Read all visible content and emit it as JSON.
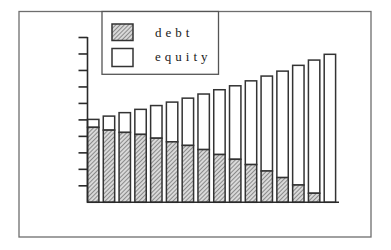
{
  "chart_data": {
    "type": "bar",
    "stacked": true,
    "title": "",
    "xlabel": "",
    "ylabel": "",
    "categories": [
      "1",
      "2",
      "3",
      "4",
      "5",
      "6",
      "7",
      "8",
      "9",
      "10",
      "11",
      "12",
      "13",
      "14",
      "15",
      "16"
    ],
    "series": [
      {
        "name": "debt",
        "pattern": "hatched",
        "values": [
          4.55,
          4.38,
          4.24,
          4.12,
          3.89,
          3.67,
          3.45,
          3.2,
          2.9,
          2.61,
          2.29,
          1.9,
          1.5,
          1.05,
          0.55,
          0.0
        ]
      },
      {
        "name": "equity",
        "pattern": "white",
        "values": [
          0.48,
          0.85,
          1.2,
          1.52,
          1.98,
          2.41,
          2.87,
          3.37,
          3.93,
          4.46,
          5.08,
          5.76,
          6.46,
          7.26,
          8.08,
          8.98
        ]
      }
    ],
    "totals": [
      5.03,
      5.23,
      5.44,
      5.64,
      5.87,
      6.08,
      6.32,
      6.57,
      6.83,
      7.07,
      7.37,
      7.66,
      7.96,
      8.31,
      8.63,
      8.98
    ],
    "ylim": [
      0,
      10
    ],
    "y_ticks": 10,
    "y_tick_labels": [],
    "x_tick_labels": [],
    "grid": false,
    "legend": {
      "position": "top-inside",
      "entries": [
        "debt",
        "equity"
      ]
    }
  },
  "legend": {
    "debt_label": "debt",
    "equity_label": "equity"
  },
  "colors": {
    "bar_outline": "#333333",
    "hatch_line": "#555555",
    "hatch_bg": "#d9d9d9",
    "equity_fill": "#ffffff"
  }
}
